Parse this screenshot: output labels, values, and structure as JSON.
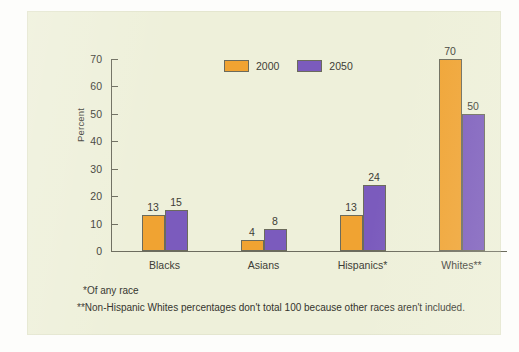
{
  "panel": {
    "background_color": "#eef0da",
    "page_color": "#fdfdfb"
  },
  "legend": {
    "position": "top-center",
    "items": [
      {
        "label": "2000",
        "color": "#f0a332",
        "swatch_name": "legend-swatch-2000"
      },
      {
        "label": "2050",
        "color": "#7b5bbd",
        "swatch_name": "legend-swatch-2050"
      }
    ]
  },
  "axes": {
    "ylabel": "Percent",
    "yticks": [
      0,
      10,
      20,
      30,
      40,
      50,
      60,
      70
    ],
    "ytick_labels": [
      "0",
      "10",
      "20",
      "30",
      "40",
      "50",
      "60",
      "70"
    ],
    "ylim": [
      0,
      70
    ],
    "grid": false
  },
  "footnotes": [
    "*Of any race",
    "**Non-Hispanic Whites percentages don't total 100 because other races aren't included."
  ],
  "chart_data": {
    "type": "bar",
    "title": "",
    "subtitle": "",
    "xlabel": "",
    "ylabel": "Percent",
    "ylim": [
      0,
      70
    ],
    "yticks": [
      0,
      10,
      20,
      30,
      40,
      50,
      60,
      70
    ],
    "grid": false,
    "legend_position": "top-center",
    "categories": [
      "Blacks",
      "Asians",
      "Hispanics*",
      "Whites**"
    ],
    "series": [
      {
        "name": "2000",
        "color": "#f0a332",
        "values": [
          13,
          4,
          13,
          70
        ]
      },
      {
        "name": "2050",
        "color": "#7b5bbd",
        "values": [
          15,
          8,
          24,
          50
        ]
      }
    ],
    "data_labels": [
      {
        "category": "Blacks",
        "2000": "13",
        "2050": "15"
      },
      {
        "category": "Asians",
        "2000": "4",
        "2050": "8"
      },
      {
        "category": "Hispanics*",
        "2000": "13",
        "2050": "24"
      },
      {
        "category": "Whites**",
        "2000": "70",
        "2050": "50"
      }
    ],
    "annotations": [
      "*Of any race",
      "**Non-Hispanic Whites percentages don't total 100 because other races aren't included."
    ]
  }
}
